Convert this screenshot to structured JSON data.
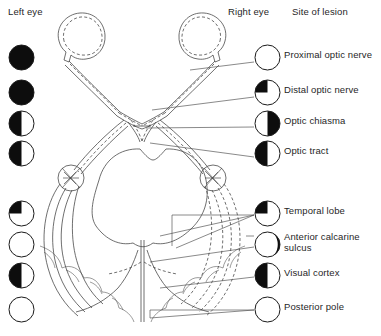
{
  "header": {
    "left_eye": "Left eye",
    "right_eye": "Right eye",
    "site_of_lesion": "Site of lesion"
  },
  "lesions": [
    {
      "id": "proximal-optic-nerve",
      "label": "Proximal optic nerve",
      "left_field": "full-blind",
      "right_field": "normal",
      "left_name": "field-defect-left-proximal-optic-nerve",
      "right_name": "field-defect-right-proximal-optic-nerve"
    },
    {
      "id": "distal-optic-nerve",
      "label": "Distal optic nerve",
      "left_field": "full-blind",
      "right_field": "upper-temporal-quadrant",
      "left_name": "field-defect-left-distal-optic-nerve",
      "right_name": "field-defect-right-distal-optic-nerve"
    },
    {
      "id": "optic-chiasma",
      "label": "Optic chiasma",
      "left_field": "temporal-hemianopia-left",
      "right_field": "temporal-hemianopia-right",
      "left_name": "field-defect-left-optic-chiasma",
      "right_name": "field-defect-right-optic-chiasma"
    },
    {
      "id": "optic-tract",
      "label": "Optic tract",
      "left_field": "homonymous-left-half",
      "right_field": "homonymous-left-half",
      "left_name": "field-defect-left-optic-tract",
      "right_name": "field-defect-right-optic-tract"
    },
    {
      "id": "temporal-lobe",
      "label": "Temporal lobe",
      "left_field": "upper-quadrant-left",
      "right_field": "upper-quadrant-left",
      "left_name": "field-defect-left-temporal-lobe",
      "right_name": "field-defect-right-temporal-lobe"
    },
    {
      "id": "anterior-calcarine-sulcus",
      "label": "Anterior calcarine\nsulcus",
      "left_field": "normal",
      "right_field": "temporal-crescent",
      "left_name": "field-defect-left-anterior-calcarine-sulcus",
      "right_name": "field-defect-right-anterior-calcarine-sulcus"
    },
    {
      "id": "visual-cortex",
      "label": "Visual cortex",
      "left_field": "homonymous-left-half",
      "right_field": "homonymous-left-half",
      "left_name": "field-defect-left-visual-cortex",
      "right_name": "field-defect-right-visual-cortex"
    },
    {
      "id": "posterior-pole",
      "label": "Posterior pole",
      "left_field": "macular-sparing",
      "right_field": "macular-sparing",
      "left_name": "field-defect-left-posterior-pole",
      "right_name": "field-defect-right-posterior-pole"
    }
  ],
  "anatomy": {
    "left_eye_globe": "left-eye-globe",
    "right_eye_globe": "right-eye-globe",
    "optic_chiasm": "optic-chiasm",
    "midbrain": "midbrain-outline",
    "left_lateral_geniculate": "left-lateral-geniculate-body",
    "right_lateral_geniculate": "right-lateral-geniculate-body",
    "occipital_cortex": "occipital-cortex"
  },
  "colors": {
    "ink": "#1a1a1a",
    "line": "#4a4a4a",
    "fill_blind": "#0d0d0d",
    "paper": "#ffffff"
  }
}
